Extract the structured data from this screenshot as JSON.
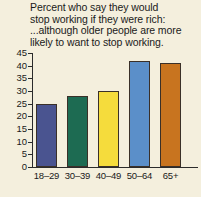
{
  "chart_data": {
    "type": "bar",
    "title": "Percent who say they would\nstop working if they were rich:",
    "subtitle": "...although older people are more\nlikely to want to stop working.",
    "xlabel": "",
    "ylabel": "",
    "categories": [
      "18–29",
      "30–39",
      "40–49",
      "50–64",
      "65+"
    ],
    "values": [
      25,
      28,
      30,
      42,
      41
    ],
    "ylim": [
      0,
      45
    ],
    "yticks": [
      0,
      5,
      10,
      15,
      20,
      25,
      30,
      35,
      40,
      45
    ],
    "ytick_labels": [
      "0",
      "5",
      "10",
      "15",
      "20",
      "25",
      "30",
      "35",
      "40",
      "45"
    ],
    "grid": false,
    "legend": "none",
    "bar_colors": [
      "#4a5490",
      "#1d6b52",
      "#f5dc3c",
      "#5b8fc9",
      "#c8741f"
    ],
    "background_color": "#f4efdd",
    "axis_color": "#2b2b2b"
  }
}
